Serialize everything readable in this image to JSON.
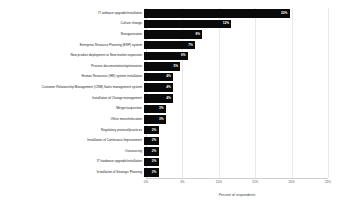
{
  "chart_data": {
    "type": "bar",
    "orientation": "horizontal",
    "title": "",
    "xlabel": "Percent of respondents",
    "ylabel": "",
    "xlim": [
      0,
      25
    ],
    "xticks": [
      0,
      5,
      10,
      15,
      20,
      25
    ],
    "xtick_labels": [
      "0%",
      "5%",
      "10%",
      "15%",
      "20%",
      "25%"
    ],
    "grid": true,
    "grid_axis": "x",
    "legend": false,
    "bar_color": "#0a0a0a",
    "value_label_color": "#ffffff",
    "categories": [
      "IT software upgrade/installation",
      "Culture change",
      "Reorganization",
      "Enterprise Resource Planning (ERP) system",
      "New product deployment or New market expansion",
      "Process documentation/optimization",
      "Human Resources (HR) system installation",
      "Customer Relationship Management (CRM) Sales management system",
      "Installation of Change management",
      "Merger/acquisition",
      "Office move/relocation",
      "Regulatory protocol/practices",
      "Installation of Continuous Improvement",
      "Outsourcing",
      "IT hardware upgrade/installation",
      "Installation of Strategic Planning"
    ],
    "values": [
      20,
      12,
      8,
      7,
      6,
      5,
      4,
      4,
      4,
      3,
      3,
      2,
      2,
      2,
      2,
      2
    ],
    "value_labels": [
      "20%",
      "12%",
      "8%",
      "7%",
      "6%",
      "5%",
      "4%",
      "4%",
      "4%",
      "3%",
      "3%",
      "2%",
      "2%",
      "2%",
      "2%",
      "2%"
    ]
  }
}
